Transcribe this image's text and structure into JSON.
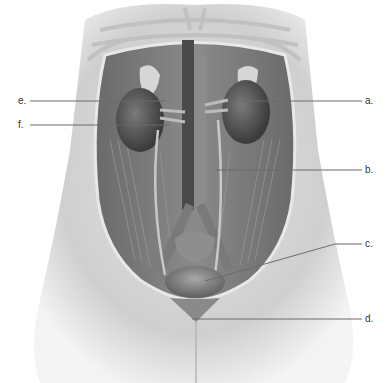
{
  "figure": {
    "labels": [
      {
        "id": "a",
        "text": "a.",
        "points_to": "kidney"
      },
      {
        "id": "b",
        "text": "b.",
        "points_to": "ureter"
      },
      {
        "id": "c",
        "text": "c.",
        "points_to": "urinary bladder"
      },
      {
        "id": "d",
        "text": "d.",
        "points_to": "urethra"
      },
      {
        "id": "e",
        "text": "e.",
        "points_to": "renal artery"
      },
      {
        "id": "f",
        "text": "f.",
        "points_to": "renal vein"
      }
    ]
  },
  "colors": {
    "skin": "#d8d8d8",
    "cavity": "#5a5a5a",
    "leader_line": "#6b6b6b",
    "label_text": "#333333"
  }
}
